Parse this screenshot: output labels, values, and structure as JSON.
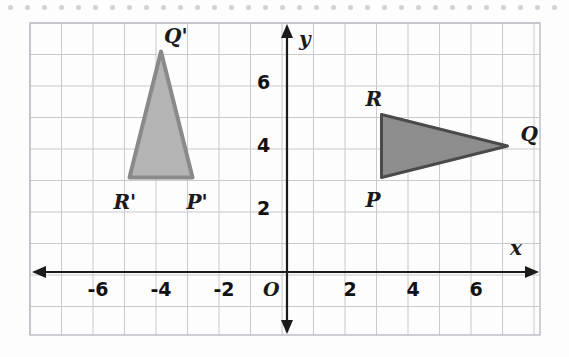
{
  "figure": {
    "type": "coordinate-plane-rotation",
    "background_color": "#fdfdfd",
    "grid_color": "#c9c9cf",
    "grid_border_color": "#b9b9c2",
    "axis_color": "#1a1a1a",
    "dot_strip": {
      "count": 34,
      "spacing": 17,
      "color": "#d2d2d2",
      "start_x": 8,
      "y": 5
    },
    "grid": {
      "left": 30,
      "top": 23,
      "right": 540,
      "bottom": 335,
      "cell": 31.5,
      "origin_px_x": 287,
      "origin_px_y": 272,
      "x_min": -8,
      "x_max": 8,
      "y_min": -2,
      "y_max": 8
    },
    "axes": {
      "x_label": "x",
      "y_label": "y",
      "origin_label": "O",
      "x_tick_labels": [
        "-6",
        "-4",
        "-2",
        "2",
        "4",
        "6"
      ],
      "x_tick_values": [
        -6,
        -4,
        -2,
        2,
        4,
        6
      ],
      "y_tick_labels": [
        "2",
        "4",
        "6"
      ],
      "y_tick_values": [
        2,
        4,
        6
      ]
    },
    "shapes": [
      {
        "name": "triangle-PQR",
        "fill": "#8d8d8d",
        "stroke": "#4a4a4a",
        "stroke_width": 3,
        "vertices": [
          {
            "label": "P",
            "x": 3,
            "y": 3,
            "label_dx": -16,
            "label_dy": 22
          },
          {
            "label": "Q",
            "x": 7,
            "y": 4,
            "label_dx": 13,
            "label_dy": -12
          },
          {
            "label": "R",
            "x": 3,
            "y": 5,
            "label_dx": -16,
            "label_dy": -16
          }
        ]
      },
      {
        "name": "triangle-P-prime-Q-prime-R-prime",
        "fill": "#b5b5b5",
        "stroke": "#8a8a8a",
        "stroke_width": 4,
        "vertices": [
          {
            "label": "P'",
            "x": -3,
            "y": 3,
            "label_dx": -6,
            "label_dy": 24
          },
          {
            "label": "Q'",
            "x": -4,
            "y": 7,
            "label_dx": 3,
            "label_dy": -16
          },
          {
            "label": "R'",
            "x": -5,
            "y": 3,
            "label_dx": -16,
            "label_dy": 24
          }
        ]
      }
    ]
  }
}
